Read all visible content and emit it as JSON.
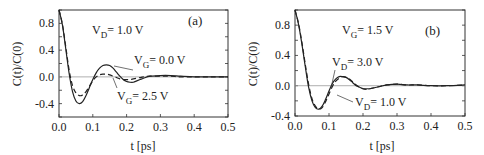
{
  "figure": {
    "panels": [
      {
        "id": "a",
        "label": "(a)",
        "ylabel": "C(t)/C(0)",
        "xlabel": "t [ps]",
        "condition": {
          "main": "V",
          "sub": "D",
          "rest": "= 1.0 V"
        },
        "annotations": [
          {
            "main": "V",
            "sub": "G",
            "rest": "= 0.0 V"
          },
          {
            "main": "V",
            "sub": "G",
            "rest": "= 2.5 V"
          }
        ]
      },
      {
        "id": "b",
        "label": "(b)",
        "ylabel": "C(t)/C(0)",
        "xlabel": "t [ps]",
        "condition": {
          "main": "V",
          "sub": "G",
          "rest": "= 1.5 V"
        },
        "annotations": [
          {
            "main": "V",
            "sub": "D",
            "rest": "= 3.0 V"
          },
          {
            "main": "V",
            "sub": "D",
            "rest": "= 1.0 V"
          }
        ]
      }
    ]
  },
  "chart_data": [
    {
      "type": "line",
      "title": "(a) V_D = 1.0 V",
      "xlabel": "t [ps]",
      "ylabel": "C(t)/C(0)",
      "xlim": [
        0.0,
        0.5
      ],
      "ylim": [
        -0.6,
        1.0
      ],
      "xticks": [
        "0.0",
        "0.1",
        "0.2",
        "0.3",
        "0.4",
        "0.5"
      ],
      "yticks": [
        "-0.4",
        "0.0",
        "0.4",
        "0.8"
      ],
      "grid": false,
      "zero_line": true,
      "x": [
        0.0,
        0.01,
        0.02,
        0.03,
        0.04,
        0.05,
        0.06,
        0.07,
        0.08,
        0.09,
        0.1,
        0.11,
        0.12,
        0.13,
        0.14,
        0.15,
        0.16,
        0.17,
        0.18,
        0.19,
        0.2,
        0.21,
        0.22,
        0.23,
        0.24,
        0.25,
        0.27,
        0.3,
        0.33,
        0.36,
        0.4,
        0.45,
        0.5
      ],
      "series": [
        {
          "name": "V_G = 0.0 V",
          "style": "solid",
          "values": [
            1.0,
            0.78,
            0.42,
            0.05,
            -0.22,
            -0.36,
            -0.4,
            -0.37,
            -0.28,
            -0.16,
            -0.04,
            0.06,
            0.13,
            0.17,
            0.18,
            0.17,
            0.13,
            0.07,
            0.01,
            -0.04,
            -0.07,
            -0.08,
            -0.08,
            -0.06,
            -0.04,
            -0.02,
            0.01,
            0.02,
            0.02,
            0.01,
            0.0,
            0.0,
            0.0
          ]
        },
        {
          "name": "V_G = 2.5 V",
          "style": "dashed",
          "values": [
            1.0,
            0.79,
            0.45,
            0.1,
            -0.13,
            -0.24,
            -0.28,
            -0.27,
            -0.22,
            -0.14,
            -0.06,
            0.0,
            0.03,
            0.04,
            0.04,
            0.03,
            0.01,
            -0.01,
            -0.03,
            -0.04,
            -0.04,
            -0.04,
            -0.03,
            -0.02,
            -0.01,
            0.0,
            0.01,
            0.01,
            0.01,
            0.0,
            0.0,
            0.0,
            0.0
          ]
        }
      ]
    },
    {
      "type": "line",
      "title": "(b) V_G = 1.5 V",
      "xlabel": "t [ps]",
      "ylabel": "C(t)/C(0)",
      "xlim": [
        0.0,
        0.5
      ],
      "ylim": [
        -0.4,
        1.0
      ],
      "xticks": [
        "0.0",
        "0.1",
        "0.2",
        "0.3",
        "0.4",
        "0.5"
      ],
      "yticks": [
        "-0.4",
        "0.0",
        "0.4",
        "0.8"
      ],
      "grid": false,
      "zero_line": true,
      "x": [
        0.0,
        0.01,
        0.02,
        0.03,
        0.04,
        0.05,
        0.06,
        0.07,
        0.08,
        0.09,
        0.1,
        0.11,
        0.12,
        0.13,
        0.14,
        0.15,
        0.16,
        0.17,
        0.18,
        0.19,
        0.2,
        0.21,
        0.22,
        0.23,
        0.24,
        0.25,
        0.27,
        0.3,
        0.33,
        0.36,
        0.4,
        0.45,
        0.5
      ],
      "series": [
        {
          "name": "V_D = 3.0 V",
          "style": "solid",
          "values": [
            1.0,
            0.82,
            0.56,
            0.26,
            -0.02,
            -0.2,
            -0.29,
            -0.31,
            -0.27,
            -0.18,
            -0.07,
            0.03,
            0.09,
            0.12,
            0.12,
            0.11,
            0.08,
            0.04,
            0.0,
            -0.02,
            -0.04,
            -0.04,
            -0.04,
            -0.03,
            -0.02,
            -0.01,
            0.01,
            0.02,
            0.01,
            0.01,
            0.0,
            0.0,
            0.01
          ]
        },
        {
          "name": "V_D = 1.0 V",
          "style": "dashed",
          "values": [
            1.0,
            0.83,
            0.58,
            0.29,
            0.02,
            -0.17,
            -0.27,
            -0.31,
            -0.29,
            -0.21,
            -0.11,
            -0.01,
            0.06,
            0.1,
            0.12,
            0.11,
            0.09,
            0.05,
            0.01,
            -0.02,
            -0.04,
            -0.05,
            -0.04,
            -0.03,
            -0.02,
            -0.01,
            0.01,
            0.02,
            0.01,
            0.01,
            0.0,
            0.0,
            0.01
          ]
        }
      ]
    }
  ]
}
